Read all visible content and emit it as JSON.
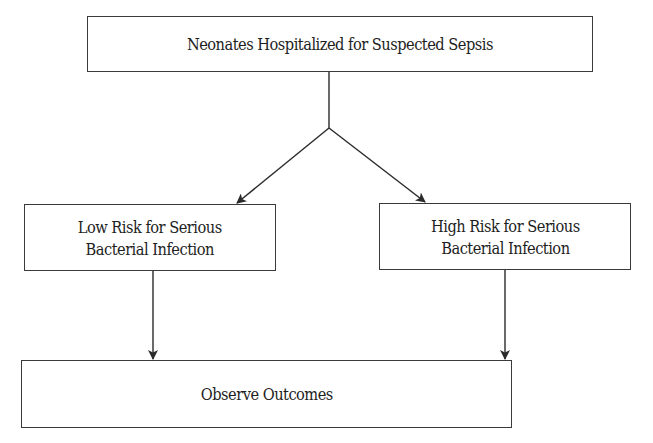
{
  "diagram": {
    "type": "flowchart",
    "nodes": [
      {
        "id": "root",
        "label": "Neonates Hospitalized for Suspected Sepsis"
      },
      {
        "id": "low",
        "label_lines": [
          "Low Risk for Serious",
          "Bacterial Infection"
        ]
      },
      {
        "id": "high",
        "label_lines": [
          "High Risk for Serious",
          "Bacterial Infection"
        ]
      },
      {
        "id": "outcome",
        "label": "Observe Outcomes"
      }
    ],
    "edges": [
      {
        "from": "root",
        "to": "low"
      },
      {
        "from": "root",
        "to": "high"
      },
      {
        "from": "low",
        "to": "outcome"
      },
      {
        "from": "high",
        "to": "outcome"
      }
    ],
    "colors": {
      "line": "#2a2a2a",
      "box_border": "#3a3a3a",
      "text": "#1e1e1e",
      "background": "#ffffff"
    }
  }
}
